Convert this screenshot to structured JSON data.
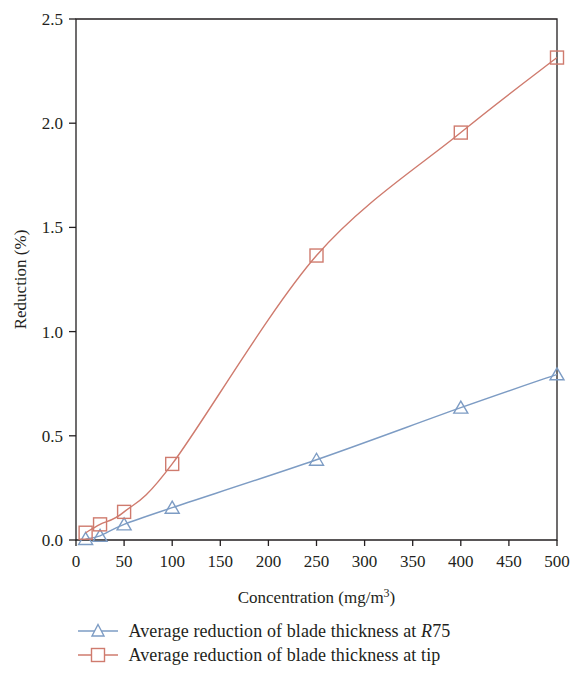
{
  "chart_data": {
    "type": "line",
    "title": "",
    "xlabel": "Concentration (mg/m3)",
    "xlabel_base": "Concentration (mg/m",
    "xlabel_sup": "3",
    "xlabel_tail": ")",
    "ylabel": "Reduction (%)",
    "xlim": [
      0,
      500
    ],
    "ylim": [
      0.0,
      2.5
    ],
    "xticks": [
      0,
      50,
      100,
      150,
      200,
      250,
      300,
      350,
      400,
      450,
      500
    ],
    "xticklabels": [
      "0",
      "50",
      "100",
      "150",
      "200",
      "250",
      "300",
      "350",
      "400",
      "450",
      "500"
    ],
    "yticks": [
      0.0,
      0.5,
      1.0,
      1.5,
      2.0,
      2.5
    ],
    "yticklabels": [
      "0.0",
      "0.5",
      "1.0",
      "1.5",
      "2.0",
      "2.5"
    ],
    "grid": false,
    "legend_position": "below",
    "x": [
      10,
      25,
      50,
      100,
      250,
      400,
      500
    ],
    "series": [
      {
        "name": "Average reduction of blade thickness at R75",
        "label_prefix": "Average reduction of blade thickness at ",
        "label_italic": "R",
        "label_suffix": "75",
        "marker": "triangle",
        "color": "#7d9cc4",
        "values": [
          0.005,
          0.02,
          0.075,
          0.155,
          0.385,
          0.635,
          0.795
        ]
      },
      {
        "name": "Average reduction of blade thickness at tip",
        "label_prefix": "Average reduction of blade thickness at tip",
        "label_italic": "",
        "label_suffix": "",
        "marker": "square",
        "color": "#cf7b6e",
        "values": [
          0.035,
          0.075,
          0.135,
          0.365,
          1.365,
          1.955,
          2.315
        ]
      }
    ]
  }
}
